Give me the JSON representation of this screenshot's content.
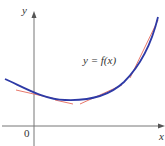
{
  "diagram": {
    "curve_label": "y = f(x)",
    "x_axis_label": "x",
    "y_axis_label": "y",
    "origin_label": "0",
    "colors": {
      "curve": "#2e3aa6",
      "tangent": "#e8786b",
      "axis": "#777777"
    },
    "tangent_count": 4
  }
}
